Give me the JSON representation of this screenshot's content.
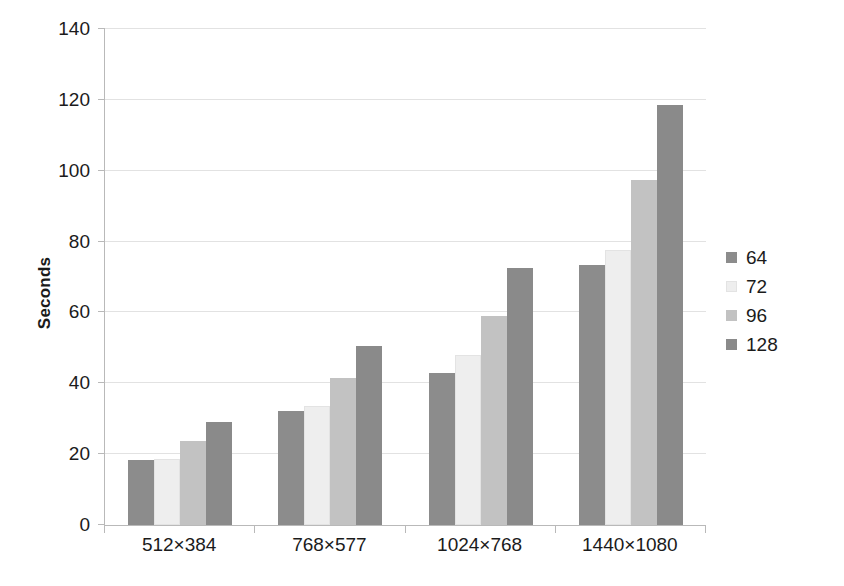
{
  "chart_data": {
    "type": "bar",
    "title": "",
    "xlabel": "",
    "ylabel": "Seconds",
    "ylim": [
      0,
      140
    ],
    "yticks": [
      0,
      20,
      40,
      60,
      80,
      100,
      120,
      140
    ],
    "ytick_labels": [
      "0",
      "20",
      "40",
      "60",
      "80",
      "100",
      "120",
      "140"
    ],
    "grid": "horizontal",
    "legend_position": "right",
    "categories": [
      "512×384",
      "768×577",
      "1024×768",
      "1440×1080"
    ],
    "series": [
      {
        "name": "64",
        "color": "#8c8c8c",
        "values": [
          18.3,
          32.2,
          43.0,
          73.5
        ]
      },
      {
        "name": "72",
        "color": "#eeeeee",
        "values": [
          18.5,
          33.6,
          48.0,
          77.5
        ]
      },
      {
        "name": "96",
        "color": "#c2c2c2",
        "values": [
          23.8,
          41.5,
          59.0,
          97.3
        ]
      },
      {
        "name": "128",
        "color": "#8a8a8a",
        "values": [
          29.0,
          50.5,
          72.5,
          118.5
        ]
      }
    ]
  },
  "axis": {
    "y_title": "Seconds"
  },
  "colors": {
    "gridline": "#e2e2e2",
    "axis": "#b9b9b9",
    "text": "#1b1b1b",
    "background": "#ffffff"
  }
}
